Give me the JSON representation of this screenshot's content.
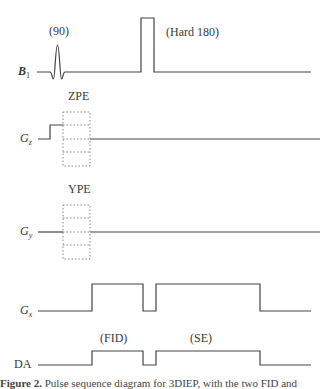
{
  "rows": {
    "b1": {
      "label": "B",
      "subscript": "1",
      "annotations": {
        "ninety": "(90)",
        "hard180": "(Hard 180)"
      }
    },
    "gz": {
      "label": "G",
      "subscript": "z",
      "annotation": "ZPE"
    },
    "gy": {
      "label": "G",
      "subscript": "y",
      "annotation": "YPE"
    },
    "gx": {
      "label": "G",
      "subscript": "x"
    },
    "da": {
      "label": "DA",
      "annotations": {
        "fid": "(FID)",
        "se": "(SE)"
      }
    }
  },
  "caption": {
    "figure": "Figure 2.",
    "text": " Pulse sequence diagram for 3DIEP, with the two FID and"
  },
  "colors": {
    "line": "#444444",
    "dotted": "#888888",
    "text": "#3a3a3a"
  }
}
